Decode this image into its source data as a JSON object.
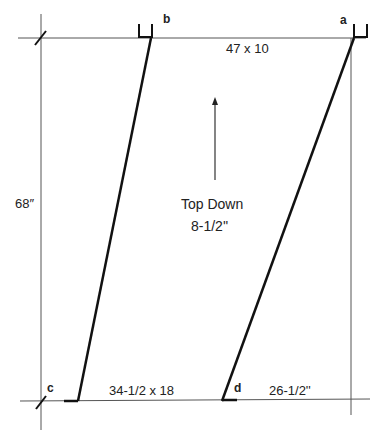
{
  "diagram": {
    "points": {
      "a": "a",
      "b": "b",
      "c": "c",
      "d": "d"
    },
    "dimensions": {
      "top_board": "47 x 10",
      "bottom_board": "34-1/2 x 18",
      "bottom_right": "26-1/2''",
      "height": "68″"
    },
    "center_note": {
      "line1": "Top Down",
      "line2": "8-1/2''"
    },
    "arrow_direction": "up",
    "colors": {
      "ink": "#111111",
      "guide": "#555555"
    }
  }
}
